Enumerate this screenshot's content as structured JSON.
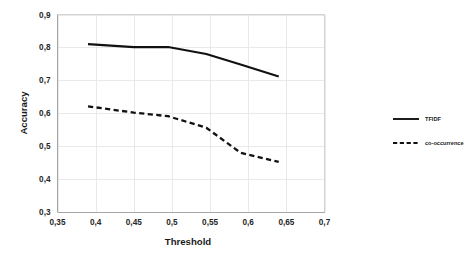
{
  "chart_data": {
    "type": "line",
    "title": "",
    "xlabel": "Threshold",
    "ylabel": "Accuracy",
    "xlim": [
      0.35,
      0.7
    ],
    "ylim": [
      0.3,
      0.9
    ],
    "grid": true,
    "legend_position": "right",
    "x_tick_labels": [
      "0,35",
      "0,4",
      "0,45",
      "0,5",
      "0,55",
      "0,6",
      "0,65",
      "0,7"
    ],
    "x_tick_values": [
      0.35,
      0.4,
      0.45,
      0.5,
      0.55,
      0.6,
      0.65,
      0.7
    ],
    "y_tick_labels": [
      "0,3",
      "0,4",
      "0,5",
      "0,6",
      "0,7",
      "0,8",
      "0,9"
    ],
    "y_tick_values": [
      0.3,
      0.4,
      0.5,
      0.6,
      0.7,
      0.8,
      0.9
    ],
    "decimal_separator": ",",
    "series": [
      {
        "name": "TFIDF",
        "style": "solid",
        "color": "#111111",
        "x": [
          0.39,
          0.45,
          0.495,
          0.545,
          0.59,
          0.64
        ],
        "values": [
          0.81,
          0.801,
          0.801,
          0.78,
          0.748,
          0.712
        ]
      },
      {
        "name": "co-occurrence",
        "style": "dashed",
        "color": "#111111",
        "x": [
          0.39,
          0.45,
          0.495,
          0.545,
          0.59,
          0.64
        ],
        "values": [
          0.621,
          0.602,
          0.591,
          0.556,
          0.48,
          0.452
        ]
      }
    ]
  },
  "legend": {
    "items": [
      {
        "label": "TFIDF",
        "style": "solid"
      },
      {
        "label": "co-occurrence",
        "style": "dashed"
      }
    ]
  },
  "axes": {
    "x_title": "Threshold",
    "y_title": "Accuracy"
  }
}
